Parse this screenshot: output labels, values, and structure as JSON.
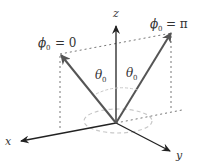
{
  "diagram": {
    "type": "3d-coordinate-vector-diagram",
    "colors": {
      "axis": "#222222",
      "vector": "#555555",
      "dotted_guide": "#777777",
      "ellipse": "#c8c8c8",
      "label": "#333333",
      "background": "#ffffff"
    },
    "axes": {
      "x": {
        "label": "x"
      },
      "y": {
        "label": "y"
      },
      "z": {
        "label": "z"
      }
    },
    "vectors": [
      {
        "name": "phi0-zero",
        "label_symbol": "ϕ",
        "label_sub": "0",
        "label_eq": "= 0"
      },
      {
        "name": "phi0-pi",
        "label_symbol": "ϕ",
        "label_sub": "0",
        "label_eq": "= π"
      }
    ],
    "angles": [
      {
        "name": "theta-left",
        "symbol": "θ",
        "sub": "0"
      },
      {
        "name": "theta-right",
        "symbol": "θ",
        "sub": "0"
      }
    ]
  }
}
